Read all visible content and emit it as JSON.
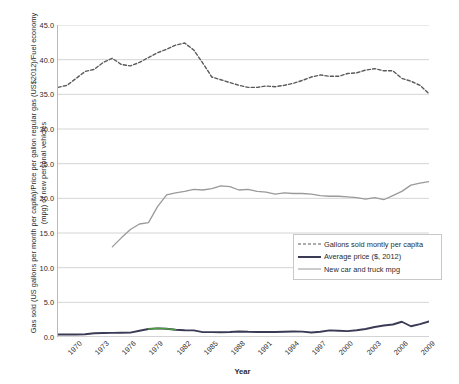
{
  "chart_data": {
    "type": "line",
    "title": "",
    "xlabel": "Year",
    "ylabel": "Gas sold (US gallons per month per capita)/Price per gallon regular gas (US$2012)/Fuel economy (mpg) of new personal vehicles",
    "ylim": [
      0.0,
      45.0
    ],
    "ytick_labels": [
      "0.0",
      "5.0",
      "10.0",
      "15.0",
      "20.0",
      "25.0",
      "30.0",
      "35.0",
      "40.0",
      "45.0"
    ],
    "ytick_values": [
      0.0,
      5.0,
      10.0,
      15.0,
      20.0,
      25.0,
      30.0,
      35.0,
      40.0,
      45.0
    ],
    "xtick_labels": [
      "1970",
      "1973",
      "1976",
      "1979",
      "1982",
      "1985",
      "1988",
      "1991",
      "1994",
      "1997",
      "2000",
      "2003",
      "2006",
      "2009"
    ],
    "xtick_values": [
      1970,
      1973,
      1976,
      1979,
      1982,
      1985,
      1988,
      1991,
      1994,
      1997,
      2000,
      2003,
      2006,
      2009
    ],
    "xlim": [
      1970,
      2011
    ],
    "grid": "horizontal",
    "legend_position": "inside-lower-right",
    "x": [
      1970,
      1971,
      1972,
      1973,
      1974,
      1975,
      1976,
      1977,
      1978,
      1979,
      1980,
      1981,
      1982,
      1983,
      1984,
      1985,
      1986,
      1987,
      1988,
      1989,
      1990,
      1991,
      1992,
      1993,
      1994,
      1995,
      1996,
      1997,
      1998,
      1999,
      2000,
      2001,
      2002,
      2003,
      2004,
      2005,
      2006,
      2007,
      2008,
      2009,
      2010,
      2011
    ],
    "series": [
      {
        "name": "Gallons sold montly per capita",
        "style": "dashed",
        "color": "#595959",
        "values": [
          36.0,
          36.3,
          37.3,
          38.3,
          38.6,
          39.6,
          40.2,
          39.3,
          39.1,
          39.6,
          40.3,
          41.0,
          41.5,
          42.1,
          42.4,
          41.4,
          39.5,
          37.5,
          37.1,
          36.7,
          36.3,
          36.0,
          36.0,
          36.2,
          36.1,
          36.3,
          36.6,
          37.0,
          37.5,
          37.8,
          37.6,
          37.6,
          38.0,
          38.1,
          38.5,
          38.7,
          38.4,
          38.4,
          37.3,
          36.9,
          36.3,
          35.1
        ]
      },
      {
        "name": "Average price ($, 2012)",
        "style": "solid",
        "color": "#3b3b56",
        "values": [
          0.35,
          0.35,
          0.35,
          0.4,
          0.55,
          0.58,
          0.6,
          0.62,
          0.63,
          0.9,
          1.15,
          1.25,
          1.18,
          1.05,
          0.98,
          0.95,
          0.7,
          0.7,
          0.68,
          0.72,
          0.8,
          0.75,
          0.73,
          0.72,
          0.72,
          0.75,
          0.8,
          0.78,
          0.65,
          0.75,
          0.95,
          0.9,
          0.85,
          0.98,
          1.15,
          1.45,
          1.65,
          1.8,
          2.2,
          1.55,
          1.85,
          2.25
        ]
      },
      {
        "name": "Average price (highlight segment)",
        "style": "solid",
        "color": "#4c9b3f",
        "values": [
          null,
          null,
          null,
          null,
          null,
          null,
          null,
          null,
          null,
          null,
          1.15,
          1.25,
          1.18,
          1.05,
          null,
          null,
          null,
          null,
          null,
          null,
          null,
          null,
          null,
          null,
          null,
          null,
          null,
          null,
          null,
          null,
          null,
          null,
          null,
          null,
          null,
          null,
          null,
          null,
          null,
          null,
          null,
          null
        ]
      },
      {
        "name": "New car and truck mpg",
        "style": "solid",
        "color": "#9a9a9a",
        "values": [
          null,
          null,
          null,
          null,
          null,
          null,
          13.0,
          14.3,
          15.5,
          16.3,
          16.5,
          18.8,
          20.5,
          20.8,
          21.0,
          21.3,
          21.2,
          21.4,
          21.8,
          21.7,
          21.2,
          21.3,
          21.0,
          20.9,
          20.6,
          20.8,
          20.7,
          20.7,
          20.6,
          20.4,
          20.3,
          20.3,
          20.2,
          20.1,
          19.9,
          20.1,
          19.8,
          20.4,
          21.0,
          21.9,
          22.2,
          22.4
        ]
      }
    ]
  },
  "legend": {
    "items": [
      {
        "label": "Gallons sold montly per capita",
        "swatch": "dashed"
      },
      {
        "label": "Average price ($, 2012)",
        "swatch": "solid-dark"
      },
      {
        "label": "New car and truck mpg",
        "swatch": "solid-gray"
      }
    ]
  },
  "axes": {
    "x_title": "Year",
    "y_title": "Gas sold (US gallons per month per capita)/Price per gallon regular gas (US$2012)/Fuel economy (mpg) of new personal vehicles"
  },
  "colors": {
    "gridline": "#c9c9c9",
    "axis": "#b9b9b9",
    "dashed_series": "#595959",
    "price_series": "#3b3b56",
    "price_highlight": "#4c9b3f",
    "mpg_series": "#9a9a9a",
    "text": "#2b2b2b"
  }
}
